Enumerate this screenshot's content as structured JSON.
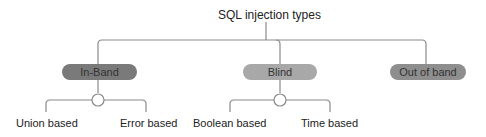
{
  "title": "SQL injection types",
  "categories": [
    {
      "label": "In-Band",
      "color": "#7a7a7a",
      "children": [
        "Union based",
        "Error based"
      ]
    },
    {
      "label": "Blind",
      "color": "#a8a8a8",
      "children": [
        "Boolean based",
        "Time based"
      ]
    },
    {
      "label": "Out of band",
      "color": "#8e8e8e",
      "children": []
    }
  ],
  "line_color": "#8a8a8a"
}
